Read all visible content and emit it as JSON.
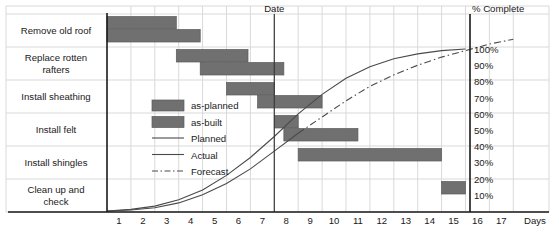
{
  "chart_data": {
    "type": "bar",
    "title": "",
    "subtitle": "",
    "xlabel": "Days",
    "ylabel": "",
    "secondary_axis_label": "% Complete",
    "date_marker_label": "Date",
    "date_marker_day": 7,
    "xlim": [
      0,
      17.8
    ],
    "x_ticks": [
      "1",
      "2",
      "3",
      "4",
      "5",
      "6",
      "7",
      "8",
      "9",
      "10",
      "11",
      "12",
      "13",
      "14",
      "15",
      "16",
      "17"
    ],
    "x_tick_values": [
      1,
      2,
      3,
      4,
      5,
      6,
      7,
      8,
      9,
      10,
      11,
      12,
      13,
      14,
      15,
      16,
      17
    ],
    "pct_ticks": [
      "100%",
      "90%",
      "80%",
      "70%",
      "60%",
      "50%",
      "40%",
      "30%",
      "20%",
      "10%"
    ],
    "pct_tick_values": [
      100,
      90,
      80,
      70,
      60,
      50,
      40,
      30,
      20,
      10
    ],
    "grid": true,
    "legend_position": "inside-left",
    "categories": [
      "Remove old roof",
      "Replace rotten rafters",
      "Install sheathing",
      "Install felt",
      "Install shingles",
      "Clean up and check"
    ],
    "series": [
      {
        "name": "as-planned",
        "type": "gantt-bar",
        "bars": [
          {
            "task": "Remove old roof",
            "start": 0.0,
            "end": 2.9
          },
          {
            "task": "Replace rotten rafters",
            "start": 2.9,
            "end": 5.9
          },
          {
            "task": "Install sheathing",
            "start": 5.0,
            "end": 7.0
          },
          {
            "task": "Install felt",
            "start": 7.0,
            "end": 8.0
          },
          {
            "task": "Install shingles",
            "start": 8.0,
            "end": 14.0
          },
          {
            "task": "Clean up and check",
            "start": 14.0,
            "end": 15.0
          }
        ]
      },
      {
        "name": "as-built",
        "type": "gantt-bar",
        "bars": [
          {
            "task": "Remove old roof",
            "start": 0.0,
            "end": 3.9
          },
          {
            "task": "Replace rotten rafters",
            "start": 3.9,
            "end": 7.4
          },
          {
            "task": "Install sheathing",
            "start": 6.3,
            "end": 9.0
          },
          {
            "task": "Install felt",
            "start": 7.4,
            "end": 10.5
          }
        ]
      },
      {
        "name": "Planned",
        "type": "line",
        "points": [
          [
            0,
            0
          ],
          [
            1,
            1
          ],
          [
            2,
            3
          ],
          [
            3,
            7
          ],
          [
            4,
            13
          ],
          [
            5,
            22
          ],
          [
            6,
            33
          ],
          [
            7,
            46
          ],
          [
            8,
            60
          ],
          [
            9,
            72
          ],
          [
            10,
            82
          ],
          [
            11,
            89
          ],
          [
            12,
            94
          ],
          [
            13,
            97
          ],
          [
            14,
            99
          ],
          [
            15,
            100
          ]
        ]
      },
      {
        "name": "Actual",
        "type": "line",
        "points": [
          [
            0,
            0
          ],
          [
            1,
            0.6
          ],
          [
            2,
            2
          ],
          [
            3,
            5
          ],
          [
            4,
            10
          ],
          [
            5,
            17
          ],
          [
            6,
            26
          ],
          [
            7,
            37
          ],
          [
            8,
            48
          ]
        ]
      },
      {
        "name": "Forecast",
        "type": "line-dashdot",
        "points": [
          [
            8,
            48
          ],
          [
            9,
            58
          ],
          [
            10,
            68
          ],
          [
            11,
            77
          ],
          [
            12,
            84
          ],
          [
            13,
            90
          ],
          [
            14,
            95
          ],
          [
            15,
            99
          ],
          [
            16,
            103
          ],
          [
            17,
            106
          ]
        ]
      }
    ],
    "legend": [
      {
        "label": "as-planned",
        "marker": "swatch",
        "color": "#707070"
      },
      {
        "label": "as-built",
        "marker": "swatch",
        "color": "#707070"
      },
      {
        "label": "Planned",
        "marker": "line",
        "color": "#4a4a4a"
      },
      {
        "label": "Actual",
        "marker": "line",
        "color": "#4a4a4a"
      },
      {
        "label": "Forecast",
        "marker": "dashdot",
        "color": "#4a4a4a"
      }
    ],
    "colors": {
      "bar_fill": "#707070",
      "bar_stroke": "#5a5a5a",
      "curve": "#4a4a4a",
      "grid": "#d9d9d9",
      "axis": "#1a1a1a",
      "text": "#1a1a1a",
      "background": "#ffffff"
    }
  }
}
